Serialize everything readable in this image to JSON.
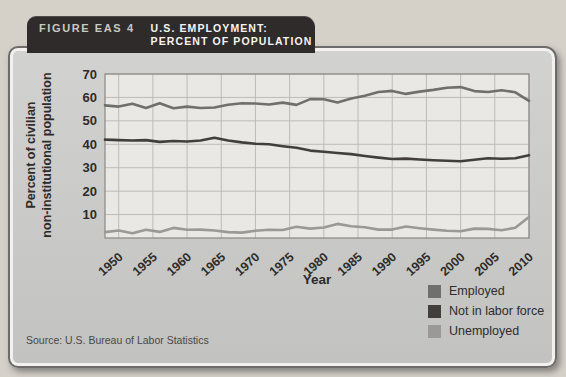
{
  "figure": {
    "label": "FIGURE EAS 4",
    "title_line1": "U.S. EMPLOYMENT:",
    "title_line2": "PERCENT OF POPULATION"
  },
  "axes": {
    "y_label_line1": "Percent of civilian",
    "y_label_line2": "non-institutional population",
    "x_label": "Year"
  },
  "source": "Source: U.S. Bureau of Labor Statistics",
  "legend": {
    "items": [
      {
        "label": "Employed",
        "color": "#6f6f6d"
      },
      {
        "label": "Not in labor force",
        "color": "#413e3c"
      },
      {
        "label": "Unemployed",
        "color": "#9b9997"
      }
    ]
  },
  "colors": {
    "page_bg": "#d5d1c9",
    "card_bg": "#c8c8c6",
    "card_border": "#6e6c6a",
    "header_bg": "#2f2b2a",
    "plot_bg": "#eae8e5",
    "grid": "#bdbbb7",
    "plot_border": "#8a8886",
    "tick_text": "#2e2c2a"
  },
  "chart_data": {
    "type": "line",
    "title": "U.S. Employment: Percent of Population",
    "xlabel": "Year",
    "ylabel": "Percent of civilian non-institutional population",
    "xlim": [
      1948,
      2010
    ],
    "ylim": [
      0,
      70
    ],
    "yticks": [
      10,
      20,
      30,
      40,
      50,
      60,
      70
    ],
    "xticks": [
      1950,
      1955,
      1960,
      1965,
      1970,
      1975,
      1980,
      1985,
      1990,
      1995,
      2000,
      2005,
      2010
    ],
    "grid": true,
    "legend_position": "bottom-right",
    "x": [
      1948,
      1950,
      1952,
      1954,
      1956,
      1958,
      1960,
      1962,
      1964,
      1966,
      1968,
      1970,
      1972,
      1974,
      1976,
      1978,
      1980,
      1982,
      1984,
      1986,
      1988,
      1990,
      1992,
      1994,
      1996,
      1998,
      2000,
      2002,
      2004,
      2006,
      2008,
      2010
    ],
    "series": [
      {
        "name": "Employed",
        "color": "#6f6f6d",
        "values": [
          56.6,
          56.1,
          57.3,
          55.5,
          57.5,
          55.4,
          56.1,
          55.5,
          55.7,
          56.9,
          57.5,
          57.4,
          57.0,
          57.8,
          56.8,
          59.3,
          59.2,
          57.8,
          59.5,
          60.7,
          62.3,
          62.8,
          61.5,
          62.5,
          63.2,
          64.1,
          64.4,
          62.7,
          62.3,
          63.1,
          62.2,
          58.5
        ]
      },
      {
        "name": "Not in labor force",
        "color": "#413e3c",
        "values": [
          42.0,
          41.8,
          41.6,
          41.8,
          41.0,
          41.4,
          41.2,
          41.6,
          42.8,
          41.6,
          40.8,
          40.2,
          40.0,
          39.2,
          38.5,
          37.3,
          36.8,
          36.3,
          35.8,
          35.0,
          34.3,
          33.7,
          33.9,
          33.5,
          33.2,
          33.0,
          32.8,
          33.4,
          34.0,
          33.8,
          34.0,
          35.3
        ]
      },
      {
        "name": "Unemployed",
        "color": "#9b9997",
        "values": [
          2.5,
          3.2,
          2.0,
          3.5,
          2.6,
          4.3,
          3.5,
          3.6,
          3.2,
          2.5,
          2.3,
          3.1,
          3.5,
          3.4,
          4.8,
          4.0,
          4.5,
          6.0,
          5.0,
          4.6,
          3.6,
          3.6,
          4.9,
          4.2,
          3.6,
          3.1,
          2.9,
          4.0,
          3.9,
          3.3,
          4.4,
          9.0
        ]
      }
    ]
  }
}
